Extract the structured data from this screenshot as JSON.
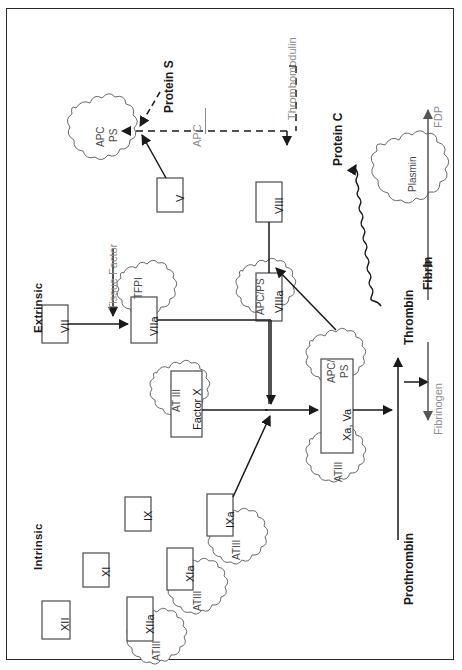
{
  "figure": {
    "type": "diagram",
    "orientation": "rotated-90-ccw",
    "frame_color": "#2b2b2b"
  },
  "sections": {
    "extrinsic_label": "Extrinsic",
    "intrinsic_label": "Intrinsic"
  },
  "factor_boxes": [
    {
      "id": "vii",
      "label": "VII"
    },
    {
      "id": "viia",
      "label": "VIIa"
    },
    {
      "id": "v",
      "label": "V"
    },
    {
      "id": "viii",
      "label": "VIII"
    },
    {
      "id": "viiia",
      "label": "VIIIa"
    },
    {
      "id": "factor-x",
      "label": "Factor X"
    },
    {
      "id": "xa-va",
      "label": "Xa, Va"
    },
    {
      "id": "xii",
      "label": "XII"
    },
    {
      "id": "xiia",
      "label": "XIIa"
    },
    {
      "id": "xi",
      "label": "XI"
    },
    {
      "id": "xia",
      "label": "XIa"
    },
    {
      "id": "ix",
      "label": "IX"
    },
    {
      "id": "ixa",
      "label": "IXa"
    }
  ],
  "inhibitor_clouds": [
    {
      "id": "apc-ps-left",
      "label": "APC\nPS",
      "line1": "APC",
      "line2": "PS"
    },
    {
      "id": "tfpi",
      "label": "TFPI"
    },
    {
      "id": "at-iii",
      "label": "AT III"
    },
    {
      "id": "apc-ps-viiia",
      "label": "APC/PS"
    },
    {
      "id": "apc-ps-xava",
      "label": "APC/\nPS",
      "line1": "APC/",
      "line2": "PS"
    },
    {
      "id": "atiii-xava",
      "label": "ATIII"
    },
    {
      "id": "atiii-ixa",
      "label": "ATIII"
    },
    {
      "id": "atiii-xia",
      "label": "ATIII"
    },
    {
      "id": "atiii-xiia",
      "label": "ATIII"
    },
    {
      "id": "plasmin",
      "label": "Plasmin"
    }
  ],
  "pathway_labels": [
    {
      "id": "tissue-factor",
      "label": "Tissue Factor",
      "emphasis": "gray"
    },
    {
      "id": "protein-s",
      "label": "Protein S",
      "emphasis": "bold"
    },
    {
      "id": "protein-c",
      "label": "Protein C",
      "emphasis": "bold"
    },
    {
      "id": "thrombomodulin",
      "label": "Thrombomodulin",
      "emphasis": "gray"
    },
    {
      "id": "apc",
      "label": "APC",
      "emphasis": "gray"
    },
    {
      "id": "thrombin",
      "label": "Thrombin",
      "emphasis": "bold"
    },
    {
      "id": "prothrombin",
      "label": "Prothrombin",
      "emphasis": "bold"
    },
    {
      "id": "fibrinogen",
      "label": "Fibrinogen",
      "emphasis": "gray"
    },
    {
      "id": "fibrin",
      "label": "Fibrin",
      "emphasis": "bold"
    },
    {
      "id": "fdp",
      "label": "FDP",
      "emphasis": "gray"
    }
  ]
}
